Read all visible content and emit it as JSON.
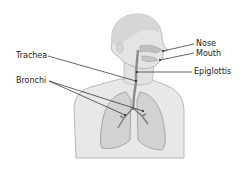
{
  "labels": {
    "nose": "Nose",
    "mouth": "Mouth",
    "trachea": "Trachea",
    "epiglottis": "Epiglottis",
    "bronchi": "Bronchi"
  },
  "colors": {
    "body_fill": "#e6e6e6",
    "body_stroke": "#9a9a9a",
    "lung_fill": "#d4d4d4",
    "airway": "#8a8a8a",
    "leader_line": "#222222"
  }
}
